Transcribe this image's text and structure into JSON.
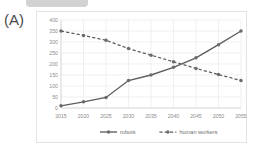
{
  "panel": {
    "label": "(A)"
  },
  "top_bar": {
    "icon": "cropped-ui-bar",
    "color": "#d2d2d2"
  },
  "colors": {
    "robots_line": "#5d5d5d",
    "human_line": "#5d5d5d",
    "marker": "#6b6b6b",
    "grid": "#e6e6e6",
    "axis": "#cfcfcf",
    "tick_text": "#8d8d8d",
    "legend_text": "#6f6f6f",
    "card_border": "#e3e3e3",
    "background": "#ffffff"
  },
  "chart_data": {
    "type": "line",
    "title": "",
    "subtitle": "",
    "xlabel": "",
    "ylabel": "",
    "x": [
      2015,
      2020,
      2025,
      2030,
      2035,
      2040,
      2045,
      2050,
      2055
    ],
    "xtick_labels": [
      "2015",
      "2020",
      "2025",
      "2030",
      "2035",
      "2040",
      "2045",
      "2050",
      "2055"
    ],
    "ytick_labels": [
      "0",
      "50",
      "100",
      "150",
      "200",
      "250",
      "300",
      "350",
      "400"
    ],
    "yticks": [
      0,
      50,
      100,
      150,
      200,
      250,
      300,
      350,
      400
    ],
    "ylim": [
      0,
      400
    ],
    "grid": true,
    "legend_position": "bottom",
    "series": [
      {
        "name": "robots",
        "style": "solid",
        "marker": "circle",
        "values": [
          10,
          28,
          48,
          125,
          150,
          185,
          228,
          288,
          350
        ]
      },
      {
        "name": "human workers",
        "style": "dashed",
        "marker": "circle",
        "values": [
          350,
          330,
          308,
          270,
          240,
          210,
          180,
          152,
          125
        ]
      }
    ]
  },
  "legend": {
    "items": [
      {
        "label": "robots",
        "style": "solid"
      },
      {
        "label": "human workers",
        "style": "dashed"
      }
    ]
  }
}
